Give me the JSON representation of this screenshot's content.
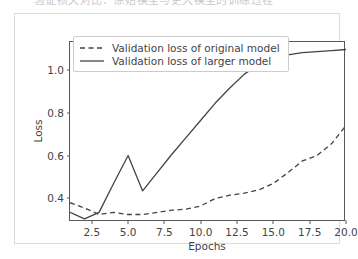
{
  "caption": {
    "text": "验证损失对比：原始模型与更大模型的训练过程"
  },
  "figure": {
    "background": "#ffffff",
    "frame_color": "#dcdcdc",
    "axis_color": "#555a5e",
    "text_color": "#3f4447"
  },
  "legend": {
    "position": "upper-left",
    "entries": [
      {
        "label": "Validation loss of original model",
        "style": "dashed",
        "color": "#3f4447",
        "swatch": "dashed-line-swatch"
      },
      {
        "label": "Validation loss of larger model",
        "style": "solid",
        "color": "#3f4447",
        "swatch": "solid-line-swatch"
      }
    ]
  },
  "chart_data": {
    "type": "line",
    "title": "",
    "xlabel": "Epochs",
    "ylabel": "Loss",
    "xlim": [
      1,
      20
    ],
    "ylim": [
      0.29,
      1.13
    ],
    "grid": false,
    "legend_position": "upper left",
    "xticks": [
      "2.5",
      "5.0",
      "7.5",
      "10.0",
      "12.5",
      "15.0",
      "17.5",
      "20.0"
    ],
    "xtick_values": [
      2.5,
      5.0,
      7.5,
      10.0,
      12.5,
      15.0,
      17.5,
      20.0
    ],
    "yticks": [
      "0.4",
      "0.6",
      "0.8",
      "1.0"
    ],
    "ytick_values": [
      0.4,
      0.6,
      0.8,
      1.0
    ],
    "x": [
      1,
      2,
      3,
      4,
      5,
      6,
      7,
      8,
      9,
      10,
      11,
      12,
      13,
      14,
      15,
      16,
      17,
      18,
      19,
      20
    ],
    "series": [
      {
        "name": "Validation loss of original model",
        "style": "dashed",
        "color": "#3f4447",
        "values": [
          0.38,
          0.355,
          0.325,
          0.335,
          0.325,
          0.325,
          0.335,
          0.345,
          0.35,
          0.365,
          0.4,
          0.415,
          0.425,
          0.44,
          0.47,
          0.52,
          0.575,
          0.6,
          0.655,
          0.74
        ]
      },
      {
        "name": "Validation loss of larger model",
        "style": "solid",
        "color": "#3f4447",
        "values": [
          0.335,
          0.305,
          0.335,
          0.47,
          0.6,
          0.435,
          0.52,
          0.605,
          0.685,
          0.765,
          0.845,
          0.915,
          0.98,
          1.025,
          1.055,
          1.07,
          1.08,
          1.085,
          1.09,
          1.095
        ]
      }
    ]
  }
}
